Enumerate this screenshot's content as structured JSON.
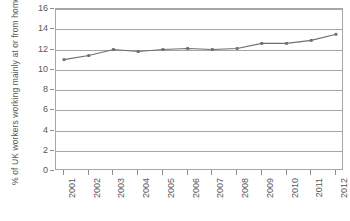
{
  "chart_data": {
    "type": "line",
    "title": "",
    "xlabel": "",
    "ylabel": "% of UK workers working mainly at or from home",
    "categories": [
      "2001",
      "2002",
      "2003",
      "2004",
      "2005",
      "2006",
      "2007",
      "2008",
      "2009",
      "2010",
      "2011",
      "2012"
    ],
    "values": [
      11.0,
      11.4,
      12.0,
      11.8,
      12.0,
      12.1,
      12.0,
      12.1,
      12.6,
      12.6,
      12.9,
      13.5
    ],
    "series": [
      {
        "name": "% of UK workers working mainly at or from home",
        "values": [
          11.0,
          11.4,
          12.0,
          11.8,
          12.0,
          12.1,
          12.0,
          12.1,
          12.6,
          12.6,
          12.9,
          13.5
        ]
      }
    ],
    "ylim": [
      0,
      16
    ],
    "yticks": [
      0,
      2,
      4,
      6,
      8,
      10,
      12,
      14,
      16
    ],
    "ytick_labels": [
      "0",
      "2",
      "4",
      "6",
      "8",
      "10",
      "12",
      "14",
      "16"
    ],
    "grid": true,
    "grid_axis": "y",
    "legend": false,
    "legend_position": "none",
    "line_color": "#6e6e70",
    "marker": "square",
    "marker_color": "#6e6e70",
    "axis_color": "#a6a6a8",
    "text_color": "#58585a"
  }
}
